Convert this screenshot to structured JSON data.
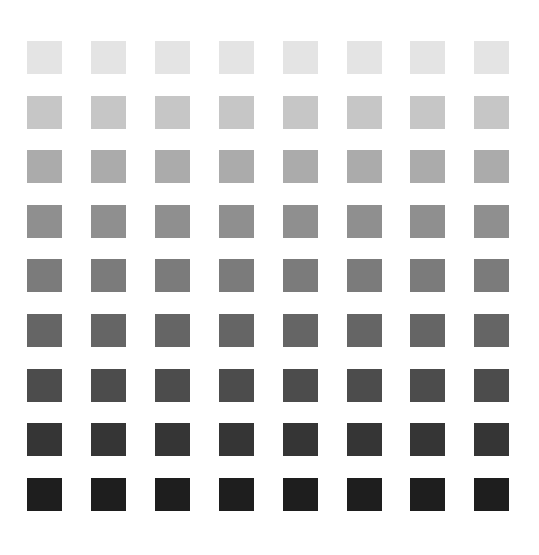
{
  "grid": {
    "rows": 9,
    "cols": 8,
    "origin_x": 27,
    "origin_y": 41,
    "col_pitch": 63.9,
    "row_pitch": 54.6,
    "square_width": 35,
    "square_height": 33,
    "background": "#ffffff",
    "row_colors": [
      "#e4e4e4",
      "#c6c6c6",
      "#ababab",
      "#8f8f8f",
      "#7b7b7b",
      "#656565",
      "#4c4c4c",
      "#353535",
      "#1e1e1e"
    ]
  }
}
